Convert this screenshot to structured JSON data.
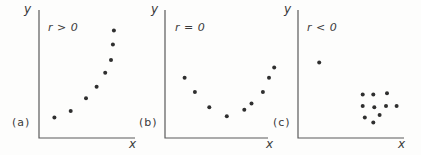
{
  "figure": {
    "background": "#fdfdfc",
    "ink_color": "#5a5a5a",
    "dot_color": "#2f2f2f",
    "text_color": "#3a3a3a"
  },
  "chart_data": [
    {
      "type": "scatter",
      "panel_label": "(a)",
      "annotation": "r > 0",
      "xlabel": "x",
      "ylabel": "y",
      "axis_range": [
        0,
        100
      ],
      "grid": false,
      "legend": "none",
      "points": [
        [
          16,
          16
        ],
        [
          33,
          21
        ],
        [
          49,
          31
        ],
        [
          60,
          40
        ],
        [
          69,
          51
        ],
        [
          75,
          61
        ],
        [
          77,
          73
        ],
        [
          78,
          84
        ]
      ]
    },
    {
      "type": "scatter",
      "panel_label": "(b)",
      "annotation": "r = 0",
      "xlabel": "x",
      "ylabel": "y",
      "axis_range": [
        0,
        100
      ],
      "grid": false,
      "legend": "none",
      "points": [
        [
          19,
          47
        ],
        [
          29,
          36
        ],
        [
          43,
          24
        ],
        [
          60,
          17
        ],
        [
          77,
          22
        ],
        [
          84,
          27
        ],
        [
          95,
          36
        ],
        [
          101,
          47
        ],
        [
          106,
          55
        ]
      ]
    },
    {
      "type": "scatter",
      "panel_label": "(c)",
      "annotation": "r < 0",
      "xlabel": "x",
      "ylabel": "y",
      "axis_range": [
        0,
        100
      ],
      "grid": false,
      "legend": "none",
      "points": [
        [
          20,
          59
        ],
        [
          61,
          34
        ],
        [
          71,
          34
        ],
        [
          84,
          35
        ],
        [
          61,
          25
        ],
        [
          72,
          24
        ],
        [
          83,
          25
        ],
        [
          93,
          25
        ],
        [
          63,
          16
        ],
        [
          77,
          18
        ],
        [
          71,
          12
        ]
      ]
    }
  ]
}
